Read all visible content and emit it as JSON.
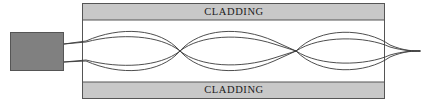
{
  "figure": {
    "type": "diagram",
    "width": 428,
    "height": 104,
    "background_color": "#ffffff"
  },
  "source_block": {
    "name": "light-source-block",
    "label": "",
    "fill_color": "#808080",
    "stroke_color": "#555555",
    "x": 10,
    "y": 32,
    "width": 54,
    "height": 39
  },
  "waveguide": {
    "x": 82,
    "y": 3,
    "width": 303,
    "height": 96,
    "core_fill": "#ffffff",
    "stroke_color": "#555555"
  },
  "cladding": {
    "fill_color": "#c8c8c8",
    "stroke_color": "#555555",
    "thickness": 17,
    "top": {
      "label": "CLADDING",
      "x": 82,
      "y": 3,
      "width": 303,
      "height": 17
    },
    "bottom": {
      "label": "CLADDING",
      "x": 82,
      "y": 82,
      "width": 303,
      "height": 17
    }
  },
  "rays": {
    "stroke_color": "#3a3a3a",
    "stroke_width": 0.9,
    "axis_y": 51,
    "launch_points": [
      {
        "x": 64,
        "y": 44
      },
      {
        "x": 64,
        "y": 62
      }
    ],
    "nodes": [
      {
        "x": 180,
        "y": 51
      },
      {
        "x": 296,
        "y": 51
      }
    ],
    "exit_point": {
      "x": 420,
      "y": 51
    },
    "outer_amplitude": 23,
    "inner_amplitude": 13,
    "paths": [
      "M 64 44 L 86 41 C 120 26 160 28 180 51 C 200 74 240 76 274 61 L 296 51",
      "M 64 62 L 86 61 C 120 76 160 74 180 51 C 200 28 240 26 274 41 L 296 51",
      "M 64 44 L 86 42 C 120 33 160 35 180 51 C 200 67 240 69 274 58 L 296 51",
      "M 64 62 L 86 60 C 120 69 160 67 180 51 C 200 35 240 33 274 44 L 296 51",
      "M 296 51 C 320 26 366 28 390 45 C 404 51 414 51 420 51",
      "M 296 51 C 320 76 366 74 390 57 C 404 51 414 51 420 51",
      "M 296 51 C 320 35 366 36 390 47 C 404 51 414 51 420 51",
      "M 296 51 C 320 67 366 66 390 55 C 404 51 414 51 420 51"
    ]
  }
}
